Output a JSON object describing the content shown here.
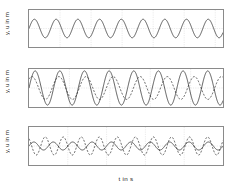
{
  "figure": {
    "background": "#ffffff",
    "axis_color": "#8a8a8a",
    "grid_color": "#c8c8c8",
    "series_color": "#1a1a1a"
  },
  "chart_data": [
    {
      "type": "line",
      "panel_index": 0,
      "title": "",
      "xlabel": "",
      "ylabel": "y, u in m",
      "xlim": [
        0,
        125
      ],
      "ylim": [
        -2,
        2
      ],
      "xticks": [
        0,
        20,
        40,
        60,
        80,
        100,
        120
      ],
      "xtick_labels": [
        "0",
        "20",
        "40",
        "60",
        "80",
        "100",
        "120"
      ],
      "yticks": [
        2,
        0,
        -2
      ],
      "ytick_labels": [
        "2",
        "0",
        "-2"
      ],
      "grid": true,
      "legend": "none",
      "series": [
        {
          "name": "y",
          "style": "solid",
          "form": "sine",
          "amplitude": 1.0,
          "period": 14.0,
          "phase": 0.0,
          "offset": 0.0
        }
      ]
    },
    {
      "type": "line",
      "panel_index": 1,
      "title": "",
      "xlabel": "",
      "ylabel": "y, u in m",
      "xlim": [
        0,
        24
      ],
      "ylim": [
        -2,
        2
      ],
      "xticks": [
        0,
        5,
        10,
        15,
        20
      ],
      "xtick_labels": [
        "0",
        "5",
        "10",
        "15",
        "20"
      ],
      "yticks": [
        2,
        0,
        -2
      ],
      "ytick_labels": [
        "2",
        "0",
        "-2"
      ],
      "grid": true,
      "legend": "none",
      "series": [
        {
          "name": "y",
          "style": "solid",
          "form": "sine",
          "amplitude": 1.8,
          "period": 3.05,
          "phase": 0.0,
          "offset": 0.0
        },
        {
          "name": "u",
          "style": "dashed",
          "form": "sine",
          "amplitude": 1.2,
          "period": 3.35,
          "phase": 0.9,
          "offset": 0.0
        }
      ]
    },
    {
      "type": "line",
      "panel_index": 2,
      "title": "",
      "xlabel": "t in s",
      "ylabel": "y, u in m",
      "xlim": [
        0,
        10
      ],
      "ylim": [
        -2,
        2
      ],
      "xticks": [
        0,
        2,
        4,
        6,
        8,
        10
      ],
      "xtick_labels": [
        "0",
        "2",
        "4",
        "6",
        "8",
        "10"
      ],
      "yticks": [
        2,
        0,
        -2
      ],
      "ytick_labels": [
        "2",
        "0",
        "-2"
      ],
      "grid": true,
      "legend": "none",
      "series": [
        {
          "name": "y",
          "style": "solid",
          "form": "sine",
          "amplitude": 0.42,
          "period": 1.0,
          "phase": 0.0,
          "offset": 0.0
        },
        {
          "name": "u",
          "style": "dashed",
          "form": "sine",
          "amplitude": 0.95,
          "period": 0.93,
          "phase": 2.2,
          "offset": 0.0
        }
      ]
    }
  ]
}
